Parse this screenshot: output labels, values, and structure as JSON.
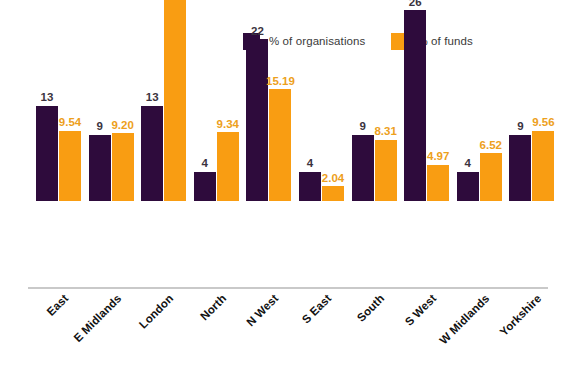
{
  "chart_data": {
    "type": "bar",
    "title": "",
    "subtitle": "",
    "xlabel": "",
    "ylabel": "",
    "grid": false,
    "legend_position": "top-right",
    "ylim": [
      0,
      34.86
    ],
    "categories": [
      "East",
      "E Midlands",
      "London",
      "North",
      "N West",
      "S East",
      "South",
      "S West",
      "W Midlands",
      "Yorkshire"
    ],
    "series": [
      {
        "name": "% of organisations",
        "color": "#2e0b3c",
        "values": [
          13,
          9,
          13,
          4,
          22,
          4,
          9,
          26,
          4,
          9
        ],
        "labels": [
          "13",
          "9",
          "13",
          "4",
          "22",
          "4",
          "9",
          "26",
          "4",
          "9"
        ]
      },
      {
        "name": "% of funds",
        "color": "#f99d12",
        "values": [
          9.54,
          9.2,
          34.86,
          9.34,
          15.19,
          2.04,
          8.31,
          4.97,
          6.52,
          9.56
        ],
        "labels": [
          "9.54",
          "9.20",
          "34.86",
          "9.34",
          "15.19",
          "2.04",
          "8.31",
          "4.97",
          "6.52",
          "9.56"
        ]
      }
    ]
  },
  "legend": {
    "entries": [
      {
        "label": "% of organisations",
        "color": "#2e0b3c"
      },
      {
        "label": "% of funds",
        "color": "#f99d12"
      }
    ]
  },
  "colors": {
    "organisations": "#2e0b3c",
    "funds": "#f99d12",
    "org_value_text": "#3b3340",
    "funds_value_text": "#eda01c",
    "category_text": "#111111",
    "axis_line": "#c9c9c9",
    "background": "#ffffff"
  }
}
